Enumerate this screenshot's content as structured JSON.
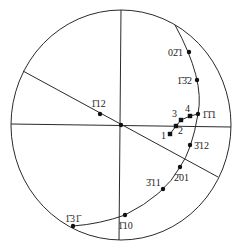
{
  "diagram": {
    "type": "stereographic-projection",
    "colors": {
      "line": "#2a2a2a",
      "marker": "#111111",
      "text": "#222222",
      "background": "#ffffff"
    },
    "primitive_circle": {
      "cx": 121,
      "cy": 125,
      "rx": 110,
      "ry": 115
    },
    "lines": [
      {
        "name": "vertical-axis",
        "x1": 121,
        "y1": 10,
        "x2": 119,
        "y2": 240
      },
      {
        "name": "horizontal-axis",
        "x1": 11,
        "y1": 124,
        "x2": 231,
        "y2": 127
      },
      {
        "name": "diagonal-trace",
        "x1": 23,
        "y1": 71,
        "x2": 218,
        "y2": 177
      }
    ],
    "great_circle_arc": {
      "path": "M175,25 Q205,80 198,114 Q192,150 180,167 Q165,195 125,215 Q100,224 73,226"
    },
    "poles": [
      {
        "id": "center",
        "x": 121,
        "y": 125,
        "label": "",
        "lx": 0,
        "ly": 0
      },
      {
        "id": "1-12",
        "x": 100,
        "y": 114,
        "label": "1̄12",
        "lx": 91,
        "ly": 107
      },
      {
        "id": "0-21",
        "x": 189,
        "y": 52,
        "label": "02̄1",
        "lx": 168,
        "ly": 56
      },
      {
        "id": "-1-32",
        "x": 197,
        "y": 80,
        "label": "1̄3̄2",
        "lx": 177,
        "ly": 84
      },
      {
        "id": "-1-11",
        "x": 198,
        "y": 114,
        "label": "1̄1̄1",
        "lx": 202,
        "ly": 118
      },
      {
        "id": "-312",
        "x": 190,
        "y": 145,
        "label": "3̄12",
        "lx": 194,
        "ly": 149
      },
      {
        "id": "-201",
        "x": 180,
        "y": 167,
        "label": "2̄01",
        "lx": 174,
        "ly": 181
      },
      {
        "id": "-311",
        "x": 163,
        "y": 189,
        "label": "3̄11",
        "lx": 146,
        "ly": 186
      },
      {
        "id": "-110",
        "x": 125,
        "y": 215,
        "label": "1̄10",
        "lx": 118,
        "ly": 229
      },
      {
        "id": "-13-1",
        "x": 73,
        "y": 226,
        "label": "1̄31̄",
        "lx": 65,
        "ly": 222
      }
    ],
    "path_points": [
      {
        "id": "1",
        "x": 170,
        "y": 134,
        "label": "1",
        "lx": 161,
        "ly": 139
      },
      {
        "id": "2",
        "x": 176,
        "y": 126,
        "label": "2",
        "lx": 178,
        "ly": 134
      },
      {
        "id": "3",
        "x": 181,
        "y": 120,
        "label": "3",
        "lx": 172,
        "ly": 117
      },
      {
        "id": "4",
        "x": 190,
        "y": 116,
        "label": "4",
        "lx": 185,
        "ly": 112
      }
    ],
    "path_trace": "M170,134 L176,126 L181,120 L190,116 L198,114"
  }
}
